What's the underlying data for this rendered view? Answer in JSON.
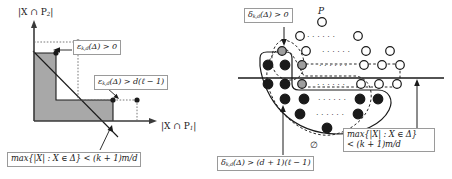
{
  "figure": {
    "background_color": "#ffffff",
    "ink_color": "#1a1a1a",
    "shade_color": "#a8a8a8",
    "box_border_color": "#9a9a9a"
  },
  "left_panel": {
    "name": "staircase-region-plot",
    "y_axis_label": "|X ∩ P",
    "y_axis_label_sub": "2",
    "y_axis_label_tail": "|",
    "x_axis_label": "|X ∩ P",
    "x_axis_label_sub": "1",
    "x_axis_label_tail": "|",
    "callouts": [
      {
        "id": "eps-greater-zero",
        "prefix": "ε",
        "sub": "k,d",
        "text": "(Δ) > 0"
      },
      {
        "id": "eps-greater-d-ell-minus-one",
        "prefix": "ε",
        "sub": "k,d",
        "text": "(Δ) > d(ℓ − 1)"
      },
      {
        "id": "max-cardinality-bound",
        "text": "max{|X| : X ∈ Δ} < (k + 1)m/d"
      }
    ]
  },
  "right_panel": {
    "name": "lattice-poset-diagram",
    "poset_label": "P",
    "empty_set_label": "∅",
    "callouts": [
      {
        "id": "delta-greater-zero",
        "prefix": "δ",
        "sub": "k,d",
        "text": "(Δ) > 0"
      },
      {
        "id": "delta-greater-d-plus-one-ell-minus-one",
        "prefix": "δ",
        "sub": "k,d",
        "text": "(Δ) > (d + 1)(ℓ − 1)"
      },
      {
        "id": "max-cardinality-bound",
        "line1": "max{|X| : X ∈ Δ}",
        "line2": "< (k + 1)m/d"
      }
    ],
    "legend": {
      "filled_circle": "element in Δ",
      "gray_circle": "boundary element",
      "open_circle": "element not in Δ",
      "ellipsis": "⋯"
    }
  }
}
